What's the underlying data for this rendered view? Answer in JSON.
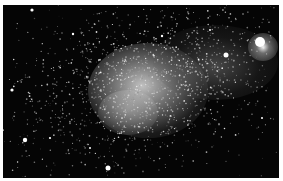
{
  "image": {
    "subject": "irregular dwarf galaxy star field",
    "background_color": "#050505",
    "border_color": "#ffffff",
    "glow_color": "#d8d8d8",
    "bright_stars": [
      {
        "x": 260,
        "y": 42,
        "r": 5
      },
      {
        "x": 226,
        "y": 55,
        "r": 2.5
      },
      {
        "x": 108,
        "y": 168,
        "r": 2.5
      },
      {
        "x": 25,
        "y": 140,
        "r": 2.2
      },
      {
        "x": 32,
        "y": 10,
        "r": 1.6
      },
      {
        "x": 12,
        "y": 90,
        "r": 1.6
      },
      {
        "x": 73,
        "y": 34,
        "r": 1.2
      },
      {
        "x": 162,
        "y": 36,
        "r": 1.2
      },
      {
        "x": 50,
        "y": 138,
        "r": 1.1
      },
      {
        "x": 90,
        "y": 148,
        "r": 1.0
      },
      {
        "x": 262,
        "y": 118,
        "r": 1.0
      },
      {
        "x": 210,
        "y": 30,
        "r": 1.0
      }
    ]
  }
}
